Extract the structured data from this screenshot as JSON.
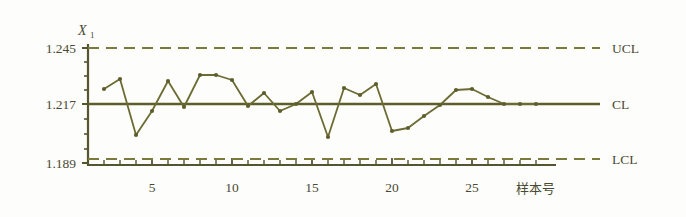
{
  "chart_data": {
    "type": "line",
    "title": "",
    "subtitle": "",
    "ylabel": "X",
    "ylabel_sub": "1",
    "xlabel": "样本号",
    "ylim": [
      1.189,
      1.245
    ],
    "xlim": [
      0,
      29
    ],
    "grid": false,
    "legend": "none",
    "y_ticks": [
      "1.245",
      "1.217",
      "1.189"
    ],
    "y_tick_values": [
      1.245,
      1.217,
      1.189
    ],
    "y_minor_tick_values": [
      1.238,
      1.231,
      1.224,
      1.21,
      1.203,
      1.196
    ],
    "x_ticks": [
      "5",
      "10",
      "15",
      "20",
      "25"
    ],
    "x_tick_values": [
      5,
      10,
      15,
      20,
      25
    ],
    "control_limits": {
      "ucl_label": "UCL",
      "ucl_value": 1.245,
      "cl_label": "CL",
      "cl_value": 1.217,
      "lcl_label": "LCL",
      "lcl_value": 1.189
    },
    "x": [
      1,
      2,
      3,
      4,
      5,
      6,
      7,
      8,
      9,
      10,
      11,
      12,
      13,
      14,
      15,
      16,
      17,
      18,
      19,
      20,
      21,
      22,
      23,
      24,
      25,
      26,
      27,
      28
    ],
    "values": [
      1.2245,
      1.2295,
      1.2015,
      1.2135,
      1.2285,
      1.2155,
      1.2315,
      1.2315,
      1.229,
      1.216,
      1.2225,
      1.2135,
      1.217,
      1.223,
      1.2005,
      1.225,
      1.2215,
      1.227,
      1.2035,
      1.205,
      1.211,
      1.2165,
      1.224,
      1.2245,
      1.2205,
      1.217,
      1.217,
      1.217
    ],
    "series": [
      {
        "name": "X1",
        "color": "#6b6b33",
        "marker": "dot",
        "values": [
          1.2245,
          1.2295,
          1.2015,
          1.2135,
          1.2285,
          1.2155,
          1.2315,
          1.2315,
          1.229,
          1.216,
          1.2225,
          1.2135,
          1.217,
          1.223,
          1.2005,
          1.225,
          1.2215,
          1.227,
          1.2035,
          1.205,
          1.211,
          1.2165,
          1.224,
          1.2245,
          1.2205,
          1.217,
          1.217,
          1.217
        ]
      }
    ],
    "colors": {
      "line": "#6b6b33",
      "axis": "#55552f",
      "limit": "#7a7a3d",
      "center": "#5e5e2c",
      "text": "#4a4a32",
      "background": "#fdfdfb"
    }
  }
}
